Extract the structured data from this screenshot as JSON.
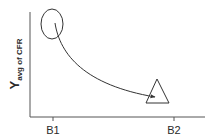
{
  "diagram": {
    "y_axis_label": {
      "main": "Y",
      "subscript": "avg of CFR"
    },
    "x_axis_ticks": [
      {
        "label": "B1"
      },
      {
        "label": "B2"
      }
    ],
    "markers": [
      {
        "shape": "ellipse",
        "position": "B1",
        "meaning": "start"
      },
      {
        "shape": "triangle",
        "position": "near B2",
        "meaning": "end"
      }
    ],
    "curve": {
      "type": "decreasing-arrow",
      "from": "ellipse",
      "to": "triangle"
    },
    "colors": {
      "stroke": "#333333",
      "text": "#2a2a2a",
      "background": "#ffffff"
    }
  }
}
